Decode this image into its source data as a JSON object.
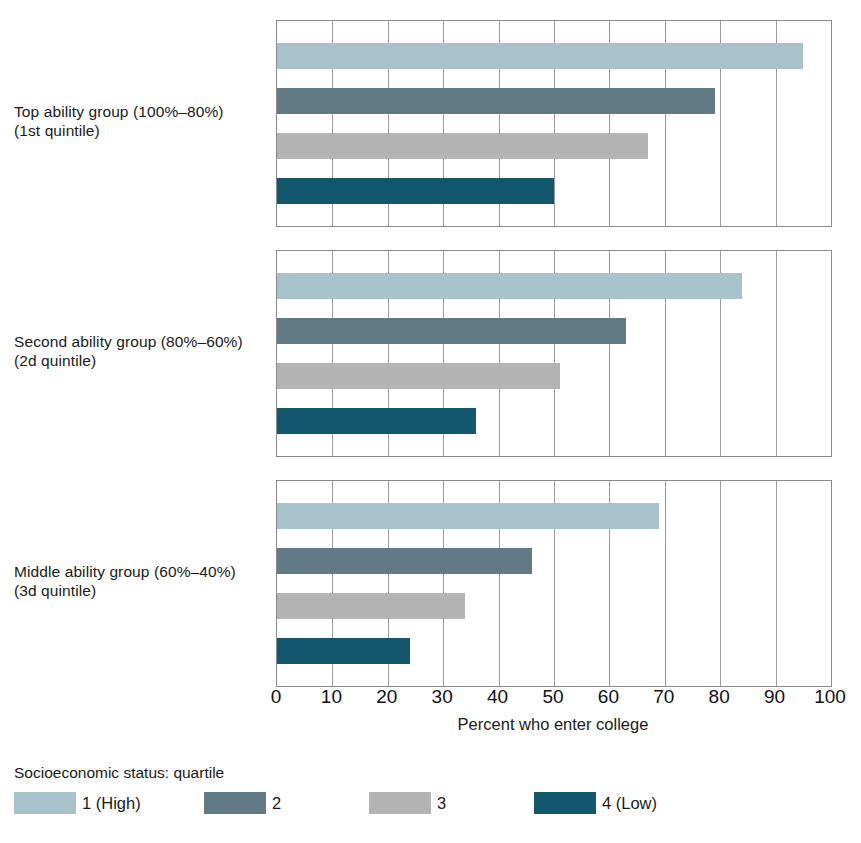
{
  "chart_data": {
    "type": "bar",
    "orientation": "horizontal",
    "title": "",
    "xlabel": "Percent who enter college",
    "ylabel": "",
    "xlim": [
      0,
      100
    ],
    "xticks": [
      0,
      10,
      20,
      30,
      40,
      50,
      60,
      70,
      80,
      90,
      100
    ],
    "xtick_labels": [
      "0",
      "10",
      "20",
      "30",
      "40",
      "50",
      "60",
      "70",
      "80",
      "90",
      "100"
    ],
    "grid": "vertical",
    "legend_position": "bottom",
    "legend_title": "Socioeconomic status: quartile",
    "categories": [
      "Top ability group (100%–80%) (1st quintile)",
      "Second ability group (80%–60%) (2d quintile)",
      "Middle ability group (60%–40%) (3d quintile)"
    ],
    "series": [
      {
        "name": "1 (High)",
        "color": "#a8c2cc",
        "values": [
          95,
          84,
          69
        ]
      },
      {
        "name": "2",
        "color": "#627a85",
        "values": [
          79,
          63,
          46
        ]
      },
      {
        "name": "3",
        "color": "#b3b3b3",
        "values": [
          67,
          51,
          34
        ]
      },
      {
        "name": "4 (Low)",
        "color": "#13576f",
        "values": [
          50,
          36,
          24
        ]
      }
    ]
  },
  "panels": [
    {
      "label_line1": "Top ability group (100%–80%)",
      "label_line2": "(1st quintile)",
      "bars": [
        {
          "series": "1 (High)",
          "value": 95,
          "color": "#a8c2cc"
        },
        {
          "series": "2",
          "value": 79,
          "color": "#627a85"
        },
        {
          "series": "3",
          "value": 67,
          "color": "#b3b3b3"
        },
        {
          "series": "4 (Low)",
          "value": 50,
          "color": "#13576f"
        }
      ]
    },
    {
      "label_line1": "Second ability group (80%–60%)",
      "label_line2": "(2d quintile)",
      "bars": [
        {
          "series": "1 (High)",
          "value": 84,
          "color": "#a8c2cc"
        },
        {
          "series": "2",
          "value": 63,
          "color": "#627a85"
        },
        {
          "series": "3",
          "value": 51,
          "color": "#b3b3b3"
        },
        {
          "series": "4 (Low)",
          "value": 36,
          "color": "#13576f"
        }
      ]
    },
    {
      "label_line1": "Middle ability group (60%–40%)",
      "label_line2": "(3d quintile)",
      "bars": [
        {
          "series": "1 (High)",
          "value": 69,
          "color": "#a8c2cc"
        },
        {
          "series": "2",
          "value": 46,
          "color": "#627a85"
        },
        {
          "series": "3",
          "value": 34,
          "color": "#b3b3b3"
        },
        {
          "series": "4 (Low)",
          "value": 24,
          "color": "#13576f"
        }
      ]
    }
  ],
  "axis": {
    "title": "Percent who enter college",
    "ticks": [
      "0",
      "10",
      "20",
      "30",
      "40",
      "50",
      "60",
      "70",
      "80",
      "90",
      "100"
    ]
  },
  "legend": {
    "title": "Socioeconomic status: quartile",
    "items": [
      {
        "label": "1 (High)",
        "color": "#a8c2cc"
      },
      {
        "label": "2",
        "color": "#627a85"
      },
      {
        "label": "3",
        "color": "#b3b3b3"
      },
      {
        "label": "4 (Low)",
        "color": "#13576f"
      }
    ]
  },
  "source_note": ""
}
